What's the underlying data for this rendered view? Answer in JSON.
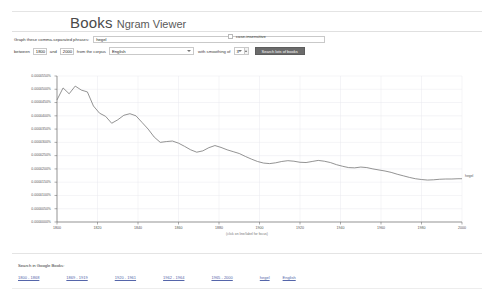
{
  "header": {
    "brand_primary": "Books",
    "brand_secondary": "Ngram Viewer"
  },
  "form": {
    "phrases_label": "Graph these comma-separated phrases:",
    "query_value": "hegel",
    "case_insensitive_label": "case-insensitive",
    "between_label": "between",
    "year_start": "1800",
    "and_label": "and",
    "year_end": "2000",
    "corpus_label": "from the corpus",
    "corpus_value": "English",
    "smoothing_label": "with smoothing of",
    "smoothing_value": "3",
    "search_button": "Search lots of books"
  },
  "chart_caption": "(click on line/label for focus)",
  "footer": {
    "title": "Search in Google Books:",
    "links": [
      "1800 - 1868",
      "1869 - 1919",
      "1920 - 1961",
      "1962 - 1964",
      "1965 - 2000",
      "hegel",
      "English"
    ]
  },
  "chart_data": {
    "type": "line",
    "title": "",
    "xlabel": "",
    "ylabel": "",
    "xlim": [
      1800,
      2000
    ],
    "ylim": [
      0.0,
      5.5e-05
    ],
    "grid": true,
    "legend": "inline-right",
    "xticks": [
      "1800",
      "1820",
      "1840",
      "1860",
      "1880",
      "1900",
      "1920",
      "1940",
      "1960",
      "1980",
      "2000"
    ],
    "yticks": [
      "0.0000550%",
      "0.0000500%",
      "0.0000450%",
      "0.0000400%",
      "0.0000350%",
      "0.0000300%",
      "0.0000250%",
      "0.0000200%",
      "0.0000150%",
      "0.0000100%",
      "0.0000050%",
      "0.0000000%"
    ],
    "series": [
      {
        "name": "hegel",
        "color": "#777777",
        "x": [
          1800,
          1803,
          1806,
          1809,
          1812,
          1815,
          1818,
          1821,
          1824,
          1827,
          1830,
          1833,
          1836,
          1839,
          1842,
          1845,
          1848,
          1851,
          1854,
          1857,
          1860,
          1863,
          1866,
          1869,
          1872,
          1875,
          1878,
          1881,
          1884,
          1887,
          1890,
          1893,
          1896,
          1899,
          1902,
          1905,
          1908,
          1911,
          1914,
          1917,
          1920,
          1923,
          1926,
          1929,
          1932,
          1935,
          1938,
          1941,
          1944,
          1947,
          1950,
          1953,
          1956,
          1959,
          1962,
          1965,
          1968,
          1971,
          1974,
          1977,
          1980,
          1983,
          1986,
          1989,
          1992,
          1995,
          1998,
          2000
        ],
        "values": [
          4.6e-05,
          5.05e-05,
          4.83e-05,
          5.12e-05,
          4.97e-05,
          4.9e-05,
          4.37e-05,
          4.1e-05,
          3.98e-05,
          3.72e-05,
          3.85e-05,
          4.02e-05,
          4.08e-05,
          4e-05,
          3.75e-05,
          3.5e-05,
          3.2e-05,
          3e-05,
          3.03e-05,
          3.05e-05,
          2.97e-05,
          2.85e-05,
          2.72e-05,
          2.63e-05,
          2.68e-05,
          2.8e-05,
          2.88e-05,
          2.81e-05,
          2.72e-05,
          2.65e-05,
          2.58e-05,
          2.47e-05,
          2.37e-05,
          2.28e-05,
          2.22e-05,
          2.2e-05,
          2.23e-05,
          2.28e-05,
          2.31e-05,
          2.29e-05,
          2.25e-05,
          2.24e-05,
          2.28e-05,
          2.32e-05,
          2.29e-05,
          2.24e-05,
          2.16e-05,
          2.1e-05,
          2.05e-05,
          2.04e-05,
          2.07e-05,
          2.05e-05,
          2e-05,
          1.96e-05,
          1.92e-05,
          1.87e-05,
          1.8e-05,
          1.74e-05,
          1.68e-05,
          1.63e-05,
          1.6e-05,
          1.58e-05,
          1.59e-05,
          1.61e-05,
          1.62e-05,
          1.62e-05,
          1.63e-05,
          1.63e-05
        ]
      }
    ]
  }
}
